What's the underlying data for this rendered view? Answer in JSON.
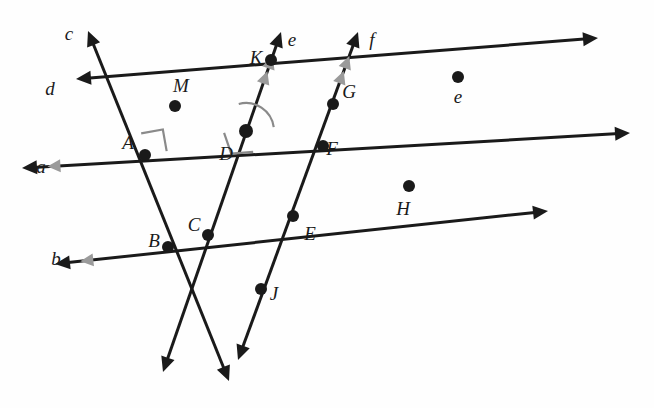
{
  "figure": {
    "background": "#fefefe",
    "stroke_color": "#1a1a1a",
    "tick_color": "#9a9a9a",
    "angle_mark_color": "#8a8a8a",
    "width": 654,
    "height": 408
  },
  "line_labels": [
    {
      "id": "c",
      "text": "c",
      "x": 69,
      "y": 33
    },
    {
      "id": "d",
      "text": "d",
      "x": 50,
      "y": 88
    },
    {
      "id": "a",
      "text": "a",
      "x": 41,
      "y": 166
    },
    {
      "id": "b",
      "text": "b",
      "x": 56,
      "y": 258
    },
    {
      "id": "e",
      "text": "e",
      "x": 292,
      "y": 39
    },
    {
      "id": "f",
      "text": "f",
      "x": 372,
      "y": 39
    }
  ],
  "point_labels": [
    {
      "id": "K",
      "text": "K",
      "x": 256,
      "y": 57
    },
    {
      "id": "M",
      "text": "M",
      "x": 181,
      "y": 85
    },
    {
      "id": "G",
      "text": "G",
      "x": 349,
      "y": 91
    },
    {
      "id": "e2",
      "text": "e",
      "x": 458,
      "y": 96
    },
    {
      "id": "A",
      "text": "A",
      "x": 128,
      "y": 142
    },
    {
      "id": "D",
      "text": "D",
      "x": 226,
      "y": 153
    },
    {
      "id": "F",
      "text": "F",
      "x": 332,
      "y": 148
    },
    {
      "id": "H",
      "text": "H",
      "x": 403,
      "y": 208
    },
    {
      "id": "B",
      "text": "B",
      "x": 154,
      "y": 240
    },
    {
      "id": "C",
      "text": "C",
      "x": 194,
      "y": 224
    },
    {
      "id": "E",
      "text": "E",
      "x": 310,
      "y": 233
    },
    {
      "id": "J",
      "text": "J",
      "x": 274,
      "y": 293
    }
  ],
  "points": [
    {
      "id": "A",
      "x": 145,
      "y": 155,
      "r": 6
    },
    {
      "id": "B",
      "x": 168,
      "y": 247,
      "r": 6
    },
    {
      "id": "C",
      "x": 208,
      "y": 235,
      "r": 6
    },
    {
      "id": "D",
      "x": 246,
      "y": 131,
      "r": 7
    },
    {
      "id": "E",
      "x": 293,
      "y": 216,
      "r": 6
    },
    {
      "id": "F",
      "x": 323,
      "y": 146,
      "r": 6
    },
    {
      "id": "G",
      "x": 333,
      "y": 104,
      "r": 6
    },
    {
      "id": "H",
      "x": 409,
      "y": 186,
      "r": 6
    },
    {
      "id": "J",
      "x": 261,
      "y": 289,
      "r": 6
    },
    {
      "id": "K",
      "x": 271,
      "y": 60,
      "r": 6
    },
    {
      "id": "M",
      "x": 175,
      "y": 106,
      "r": 6
    },
    {
      "id": "e",
      "x": 458,
      "y": 77,
      "r": 6
    }
  ],
  "lines": [
    {
      "id": "a",
      "from_x": 22,
      "from_y": 168,
      "to_x": 630,
      "to_y": 133,
      "arrow_start": true,
      "arrow_end": true,
      "ticks": 1,
      "width": 3
    },
    {
      "id": "b",
      "from_x": 55,
      "from_y": 264,
      "to_x": 548,
      "to_y": 211,
      "arrow_start": true,
      "arrow_end": true,
      "ticks": 1,
      "width": 3
    },
    {
      "id": "c",
      "from_x": 88,
      "from_y": 31,
      "to_x": 229,
      "to_y": 381,
      "arrow_start": true,
      "arrow_end": true,
      "ticks": 0,
      "width": 3
    },
    {
      "id": "d",
      "from_x": 76,
      "from_y": 79,
      "to_x": 598,
      "to_y": 38,
      "arrow_start": true,
      "arrow_end": true,
      "ticks": 0,
      "width": 3
    },
    {
      "id": "e",
      "from_x": 281,
      "from_y": 32,
      "to_x": 163,
      "to_y": 372,
      "arrow_start": true,
      "arrow_end": true,
      "ticks": 2,
      "width": 3
    },
    {
      "id": "f",
      "from_x": 358,
      "from_y": 32,
      "to_x": 238,
      "to_y": 360,
      "arrow_start": true,
      "arrow_end": true,
      "ticks": 2,
      "width": 3
    }
  ],
  "right_angles": [
    {
      "id": "angle-at-A",
      "x": 145,
      "y": 155,
      "size": 22,
      "dir1": 350,
      "dir2": 260
    },
    {
      "id": "angle-at-D",
      "x": 246,
      "y": 131,
      "size": 22,
      "dir1": 175,
      "dir2": 71
    }
  ],
  "arc_marks": [
    {
      "id": "arc-at-D",
      "x": 246,
      "y": 131,
      "r": 28,
      "start": 255,
      "end": 352
    }
  ]
}
